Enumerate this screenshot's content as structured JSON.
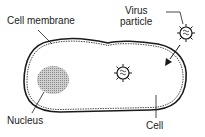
{
  "diagram": {
    "labels": {
      "cell_membrane": "Cell membrane",
      "virus_line1": "Virus",
      "virus_line2": "particle",
      "nucleus": "Nucleus",
      "cell": "Cell"
    },
    "colors": {
      "outline": "#1a1a1a",
      "nucleus_fill": "#a8a8a8",
      "background": "#ffffff"
    }
  }
}
